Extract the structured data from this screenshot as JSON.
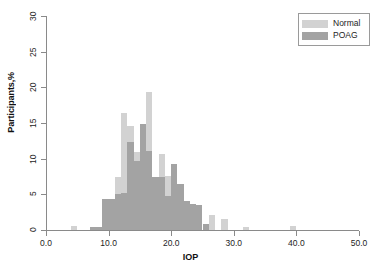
{
  "chart_data": {
    "type": "bar",
    "subtype": "overlaid-histogram",
    "title": "",
    "xlabel": "IOP",
    "ylabel": "Participants,%",
    "xlim": [
      0.0,
      50.0
    ],
    "ylim": [
      0,
      30
    ],
    "xticks": [
      "0.0",
      "10.0",
      "20.0",
      "30.0",
      "40.0",
      "50.0"
    ],
    "xtick_values": [
      0,
      10,
      20,
      30,
      40,
      50
    ],
    "yticks": [
      "0",
      "5",
      "10",
      "15",
      "20",
      "25",
      "30"
    ],
    "ytick_values": [
      0,
      5,
      10,
      15,
      20,
      25,
      30
    ],
    "grid": false,
    "legend_position": "top-right",
    "bin_width": 1.0,
    "colors": {
      "normal": "#d2d2d2",
      "poag": "#a3a3a3",
      "axis": "#8a8a8a",
      "text": "#1d1d1d",
      "background": "#ffffff"
    },
    "series": [
      {
        "name": "Normal",
        "color": "#d2d2d2",
        "x": [
          4.5,
          5.5,
          7.5,
          8.5,
          9.5,
          10.5,
          11.5,
          12.5,
          13.5,
          14.5,
          15.5,
          16.5,
          17.5,
          18.5,
          19.5,
          20.5,
          21.5,
          22.5,
          23.5,
          24.5,
          25.5,
          26.5,
          28.5,
          32.0,
          39.5
        ],
        "values": [
          0.5,
          0.0,
          0.4,
          0.4,
          4.3,
          4.4,
          7.5,
          16.4,
          14.6,
          11.0,
          11.5,
          19.4,
          7.5,
          10.7,
          7.6,
          9.2,
          6.4,
          4.1,
          3.6,
          3.5,
          0.9,
          2.1,
          1.6,
          0.4,
          0.5
        ]
      },
      {
        "name": "POAG",
        "color": "#a3a3a3",
        "x": [
          4.5,
          5.5,
          7.5,
          8.5,
          9.5,
          10.5,
          11.5,
          12.5,
          13.5,
          14.5,
          15.5,
          16.5,
          17.5,
          18.5,
          19.5,
          20.5,
          21.5,
          22.5,
          23.5,
          24.5,
          25.5,
          26.5,
          28.5,
          32.0,
          39.5
        ],
        "values": [
          0.0,
          0.0,
          0.4,
          0.4,
          4.3,
          4.4,
          5.1,
          5.2,
          12.4,
          9.7,
          14.8,
          11.1,
          7.5,
          7.5,
          4.8,
          9.2,
          6.4,
          4.1,
          3.6,
          3.5,
          0.9,
          0.0,
          0.0,
          0.0,
          0.0
        ]
      }
    ]
  },
  "legend": {
    "entries": [
      {
        "label": "Normal",
        "color": "#d2d2d2"
      },
      {
        "label": "POAG",
        "color": "#a3a3a3"
      }
    ]
  }
}
